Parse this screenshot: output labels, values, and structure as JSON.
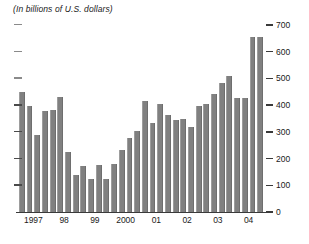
{
  "chart_title": "(In billions of U.S. dollars)",
  "axis": {
    "right_ticks": [
      "700",
      "600",
      "500",
      "400",
      "300",
      "200",
      "100",
      "0"
    ],
    "left_ticks_count": 7,
    "x_labels": [
      "1997",
      "98",
      "99",
      "2000",
      "01",
      "02",
      "03",
      "04"
    ]
  },
  "colors": {
    "bar": "#808080",
    "axis": "#3a3a3a",
    "text": "#1a1a1a",
    "background": "#ffffff"
  },
  "chart_data": {
    "type": "bar",
    "title": "(In billions of U.S. dollars)",
    "xlabel": "",
    "ylabel": "",
    "ylim": [
      0,
      700
    ],
    "yticks": [
      0,
      100,
      200,
      300,
      400,
      500,
      600,
      700
    ],
    "grid": false,
    "legend": "none",
    "categories": [
      "1997Q1",
      "1997Q2",
      "1997Q3",
      "1997Q4",
      "1998Q1",
      "1998Q2",
      "1998Q3",
      "1998Q4",
      "1999Q1",
      "1999Q2",
      "1999Q3",
      "1999Q4",
      "2000Q1",
      "2000Q2",
      "2000Q3",
      "2000Q4",
      "2001Q1",
      "2001Q2",
      "2001Q3",
      "2001Q4",
      "2002Q1",
      "2002Q2",
      "2002Q3",
      "2002Q4",
      "2003Q1",
      "2003Q2",
      "2003Q3",
      "2003Q4",
      "2004Q1",
      "2004Q2",
      "2004Q3",
      "2004Q4"
    ],
    "values": [
      450,
      395,
      290,
      378,
      382,
      430,
      224,
      140,
      172,
      124,
      175,
      122,
      178,
      232,
      276,
      305,
      415,
      335,
      405,
      365,
      345,
      348,
      318,
      398,
      403,
      440,
      483,
      508,
      428,
      425,
      655,
      655
    ],
    "x_group_labels": [
      "1997",
      "98",
      "99",
      "2000",
      "01",
      "02",
      "03",
      "04"
    ]
  }
}
